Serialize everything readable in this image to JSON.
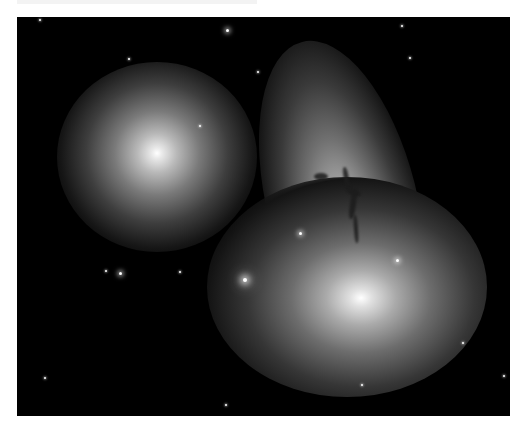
{
  "image": {
    "subject": "interacting galaxy group",
    "description": "Deep-space photograph of three galaxies: a round elliptical galaxy at upper left, a bright elliptical galaxy at lower center-right, and an edge-on disk galaxy with a dark dust lane at upper right, with scattered foreground stars on a black background",
    "background_color": "#000000",
    "page_color": "#ffffff"
  },
  "objects": {
    "galaxies": [
      {
        "name": "elliptical-upper-left",
        "cx": 157,
        "cy": 155,
        "color": "#ffffff"
      },
      {
        "name": "elliptical-lower-right",
        "cx": 345,
        "cy": 283,
        "color": "#ffffff"
      },
      {
        "name": "disk-galaxy-with-dust-lane",
        "cx": 345,
        "cy": 195,
        "color": "#bcbcbc"
      }
    ],
    "stars": [
      {
        "x": 245,
        "y": 280,
        "size": "big"
      },
      {
        "x": 300,
        "y": 233,
        "size": "med"
      },
      {
        "x": 397,
        "y": 260,
        "size": "med"
      },
      {
        "x": 120,
        "y": 273,
        "size": "med"
      },
      {
        "x": 180,
        "y": 272,
        "size": "small"
      },
      {
        "x": 106,
        "y": 271,
        "size": "small"
      },
      {
        "x": 227,
        "y": 30,
        "size": "med"
      },
      {
        "x": 258,
        "y": 72,
        "size": "small"
      },
      {
        "x": 40,
        "y": 20,
        "size": "small"
      },
      {
        "x": 402,
        "y": 26,
        "size": "small"
      },
      {
        "x": 200,
        "y": 126,
        "size": "small"
      },
      {
        "x": 129,
        "y": 59,
        "size": "small"
      },
      {
        "x": 410,
        "y": 58,
        "size": "small"
      },
      {
        "x": 504,
        "y": 376,
        "size": "small"
      },
      {
        "x": 362,
        "y": 385,
        "size": "small"
      },
      {
        "x": 226,
        "y": 405,
        "size": "small"
      },
      {
        "x": 45,
        "y": 378,
        "size": "small"
      },
      {
        "x": 463,
        "y": 343,
        "size": "small"
      }
    ]
  }
}
